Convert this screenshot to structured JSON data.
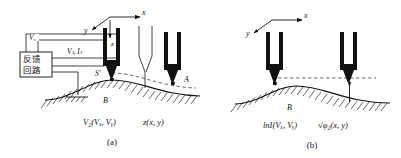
{
  "figure": {
    "panels": [
      {
        "id": "a",
        "caption": "(a)",
        "mode_name": "constant-current mode",
        "axes": {
          "x": "x",
          "y": "y",
          "z": "z"
        },
        "feedback_box": {
          "line1": "反馈",
          "line2": "回路"
        },
        "labels": {
          "bias": "V",
          "bias_sub": "s",
          "tunnel": "V",
          "tunnel_sub": "t",
          "tunnel_current": "I",
          "tunnel_current_sub": "t",
          "tunnel_combined": "Vₜ, Iₜ",
          "point_s": "S",
          "point_s_prime": "S′",
          "point_a": "A",
          "surface_b": "B"
        },
        "bottom_labels": {
          "left": "V",
          "left_sub": "z",
          "left_args": "(V",
          "left_args_sub1": "x",
          "left_args_mid": ", V",
          "left_args_sub2": "y",
          "left_args_end": ")",
          "left_full": "V₂(Vₓ, Vᵧ)",
          "right_full": "z(x, y)"
        }
      },
      {
        "id": "b",
        "caption": "(b)",
        "mode_name": "constant-height mode",
        "axes": {
          "x": "x",
          "y": "y"
        },
        "labels": {
          "surface_b": "B"
        },
        "bottom_labels": {
          "left_full": "lnI(Vₓ, Vᵧ)",
          "right_full": "√φ₂(x, y)"
        }
      }
    ],
    "colors": {
      "ink": "#111111",
      "background": "#ffffff",
      "tip_fill": "#1a1a1a",
      "dash": "#444444"
    },
    "icon_names": {
      "ground": "ground-icon",
      "arrow_x": "axis-arrow-x-icon",
      "arrow_y": "axis-arrow-y-icon",
      "arrow_z": "axis-arrow-z-icon",
      "tip": "stm-tip-icon",
      "hatch": "surface-hatch-icon",
      "dashed_path": "dashed-scan-path-icon"
    }
  }
}
